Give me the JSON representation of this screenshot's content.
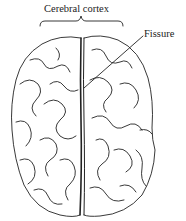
{
  "diagram": {
    "labels": {
      "cortex": "Cerebral cortex",
      "fissure": "Fissure"
    },
    "colors": {
      "stroke": "#222222",
      "background": "#ffffff"
    }
  }
}
